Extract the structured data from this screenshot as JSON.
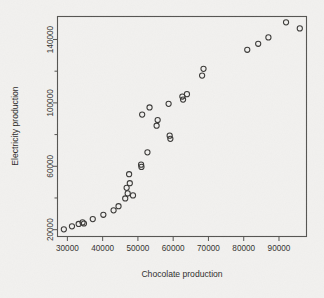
{
  "chart_data": {
    "type": "scatter",
    "title": "",
    "xlabel": "Chocolate production",
    "ylabel": "Electricity production",
    "xlim": [
      27200,
      97800
    ],
    "ylim": [
      15700,
      154500
    ],
    "grid": false,
    "legend": null,
    "marker": "open-circle",
    "x_ticks": [
      30000,
      40000,
      50000,
      60000,
      70000,
      80000,
      90000
    ],
    "x_tick_labels": [
      "30000",
      "40000",
      "50000",
      "60000",
      "70000",
      "80000",
      "90000"
    ],
    "y_ticks": [
      20000,
      60000,
      100000,
      140000
    ],
    "y_tick_labels": [
      "20000",
      "60000",
      "100000",
      "140000"
    ],
    "y_minor_ticks": [
      40000,
      80000,
      120000
    ],
    "points": [
      {
        "x": 29000,
        "y": 20200
      },
      {
        "x": 31300,
        "y": 22100
      },
      {
        "x": 33200,
        "y": 23600
      },
      {
        "x": 34300,
        "y": 24600
      },
      {
        "x": 34700,
        "y": 23900
      },
      {
        "x": 37200,
        "y": 26700
      },
      {
        "x": 40200,
        "y": 29400
      },
      {
        "x": 43100,
        "y": 32200
      },
      {
        "x": 44500,
        "y": 34800
      },
      {
        "x": 46400,
        "y": 39700
      },
      {
        "x": 46800,
        "y": 46400
      },
      {
        "x": 47100,
        "y": 42900
      },
      {
        "x": 47500,
        "y": 55000
      },
      {
        "x": 47700,
        "y": 49300
      },
      {
        "x": 48600,
        "y": 41600
      },
      {
        "x": 50900,
        "y": 61000
      },
      {
        "x": 51000,
        "y": 59600
      },
      {
        "x": 51200,
        "y": 92600
      },
      {
        "x": 52700,
        "y": 68800
      },
      {
        "x": 53300,
        "y": 97100
      },
      {
        "x": 55300,
        "y": 85600
      },
      {
        "x": 55600,
        "y": 89200
      },
      {
        "x": 58700,
        "y": 99400
      },
      {
        "x": 59000,
        "y": 79300
      },
      {
        "x": 59200,
        "y": 77300
      },
      {
        "x": 62600,
        "y": 104000
      },
      {
        "x": 62800,
        "y": 102100
      },
      {
        "x": 63900,
        "y": 105500
      },
      {
        "x": 68200,
        "y": 117200
      },
      {
        "x": 68600,
        "y": 121500
      },
      {
        "x": 81000,
        "y": 133500
      },
      {
        "x": 84100,
        "y": 137300
      },
      {
        "x": 87000,
        "y": 141300
      },
      {
        "x": 92000,
        "y": 150800
      },
      {
        "x": 95900,
        "y": 147000
      }
    ]
  },
  "axis": {
    "x_title": "Chocolate production",
    "y_title": "Electricity production"
  }
}
